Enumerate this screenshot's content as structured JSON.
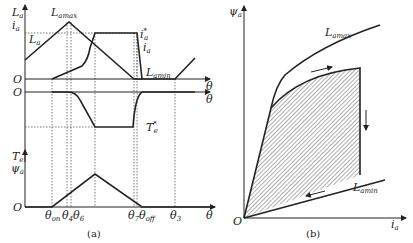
{
  "figure_a": {
    "caption": "(a)",
    "plot1": {
      "y_label_main": "L",
      "y_label_main_sub": "a",
      "y_label_2": "i",
      "y_label_2_sub": "a",
      "origin": "O",
      "x_label": "θ",
      "curves": {
        "La": {
          "label": "L",
          "sub": "a"
        },
        "Lamax": {
          "label": "L",
          "sub": "amax"
        },
        "Lamin": {
          "label": "L",
          "sub": "amin"
        },
        "ia_ref": {
          "label": "i",
          "sub": "a",
          "sup": "*"
        },
        "ia": {
          "label": "i",
          "sub": "a"
        }
      }
    },
    "plot2": {
      "origin": "O",
      "x_label": "θ",
      "Te_ref": {
        "label": "T",
        "sub": "e",
        "sup": "*"
      }
    },
    "plot3": {
      "y_label_1": "T",
      "y_label_1_sub": "e",
      "y_label_2": "ψ",
      "y_label_2_sub": "a",
      "origin": "O",
      "x_label": "θ",
      "x_ticks": [
        {
          "label": "θ",
          "sub": "on"
        },
        {
          "label": "θ",
          "sub": "4"
        },
        {
          "label": "θ",
          "sub": "6"
        },
        {
          "label": "θ",
          "sub": "7"
        },
        {
          "label": "θ",
          "sub": "off"
        },
        {
          "label": "θ",
          "sub": "3"
        }
      ]
    }
  },
  "figure_b": {
    "caption": "(b)",
    "y_label": "ψ",
    "y_label_sub": "a",
    "x_label": "i",
    "x_label_sub": "a",
    "origin": "O",
    "curves": {
      "Lamax": {
        "label": "L",
        "sub": "amax"
      },
      "Lamin": {
        "label": "L",
        "sub": "amin"
      }
    }
  }
}
